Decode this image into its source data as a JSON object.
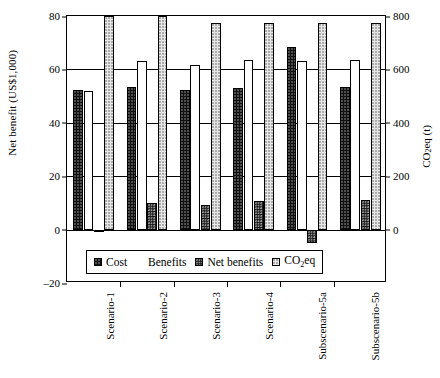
{
  "chart_data": {
    "type": "bar",
    "title": "",
    "subtitle": "",
    "categories": [
      "Scenario-1",
      "Scenario-2",
      "Scenario-3",
      "Scenario-4",
      "Subscenario-5a",
      "Subscenario-5b"
    ],
    "series": [
      {
        "name": "Cost",
        "axis": "left",
        "unit": "US$1,000",
        "values": [
          52.2,
          53.3,
          52.3,
          53.2,
          68.3,
          53.3
        ]
      },
      {
        "name": "Benefits",
        "axis": "left",
        "unit": "US$1,000",
        "values": [
          51.9,
          63.3,
          61.7,
          63.6,
          63.3,
          63.6
        ]
      },
      {
        "name": "Net benefits",
        "axis": "left",
        "unit": "US$1,000",
        "values": [
          -0.4,
          10.1,
          9.4,
          10.6,
          -5.0,
          11.1
        ]
      },
      {
        "name": "CO2eq",
        "axis": "right",
        "unit": "t",
        "values": [
          800,
          800,
          775,
          775,
          775,
          775
        ]
      }
    ],
    "xlabel": "",
    "ylabel": "Net benefit (US$1,000)",
    "ylabel_right": "CO2eq (t)",
    "ylim": [
      -20,
      80
    ],
    "yticks": [
      80,
      60,
      40,
      20,
      0,
      -20
    ],
    "ylim_right": [
      -200,
      800
    ],
    "yticks_right": [
      800,
      600,
      400,
      200,
      0
    ],
    "grid": true,
    "legend_position": "inside-bottom-center",
    "legend_entries": [
      "Cost",
      "Benefits",
      "Net benefits",
      "CO2eq"
    ]
  },
  "axes": {
    "left": {
      "title_text": "Net benefit (US$1,000)",
      "ticks": [
        {
          "label": "80"
        },
        {
          "label": "60"
        },
        {
          "label": "40"
        },
        {
          "label": "20"
        },
        {
          "label": "0"
        },
        {
          "label": "-20"
        }
      ]
    },
    "right": {
      "title_main": "CO",
      "title_sub": "2",
      "title_tail": "eq (t)",
      "ticks": [
        {
          "label": "800"
        },
        {
          "label": "600"
        },
        {
          "label": "400"
        },
        {
          "label": "200"
        },
        {
          "label": "0"
        }
      ]
    },
    "x": {
      "labels": [
        {
          "label": "Scenario-1"
        },
        {
          "label": "Scenario-2"
        },
        {
          "label": "Scenario-3"
        },
        {
          "label": "Scenario-4"
        },
        {
          "label": "Subscenario-5a"
        },
        {
          "label": "Subscenario-5b"
        }
      ]
    }
  },
  "legend": {
    "items": [
      {
        "label": "Cost",
        "swatch": "cost-swatch"
      },
      {
        "label": "Benefits",
        "swatch": "benefits-swatch"
      },
      {
        "label": "Net benefits",
        "swatch": "net-benefits-swatch"
      }
    ],
    "co2_label_main": "CO",
    "co2_label_sub": "2",
    "co2_label_tail": "eq",
    "co2_swatch": "co2eq-swatch"
  },
  "colors": {
    "cost": "#111111",
    "benefits": "#ffffff",
    "net_benefits": "#141414",
    "co2eq": "#e8e8e8",
    "axis": "#000000",
    "background": "#ffffff"
  }
}
